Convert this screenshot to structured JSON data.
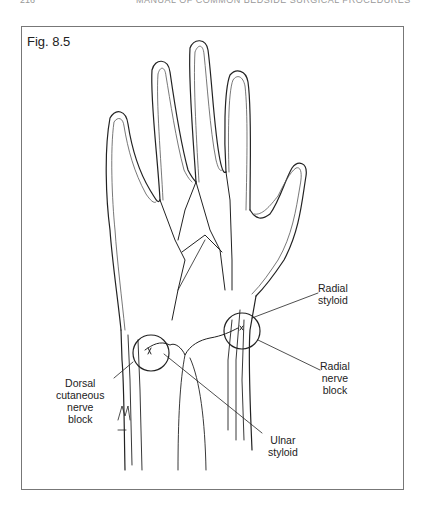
{
  "running_head": {
    "page_number": "216",
    "book_title": "MANUAL OF COMMON BEDSIDE SURGICAL PROCEDURES"
  },
  "figure": {
    "label": "Fig. 8.5",
    "annotations": {
      "radial_styloid": [
        "Radial",
        "styloid"
      ],
      "radial_nerve_block": [
        "Radial",
        "nerve",
        "block"
      ],
      "dorsal_cutaneous_nerve_block": [
        "Dorsal",
        "cutaneous",
        "nerve",
        "block"
      ],
      "ulnar_styloid": [
        "Ulnar",
        "styloid"
      ]
    },
    "signature": "Belser"
  }
}
